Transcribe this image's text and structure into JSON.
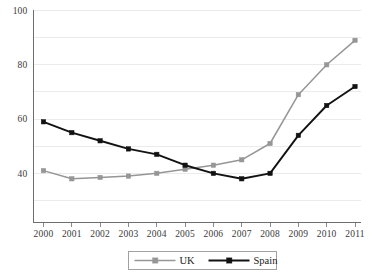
{
  "chart_data": {
    "type": "line",
    "title": "",
    "subtitle": "",
    "xlabel": "",
    "ylabel": "",
    "categories": [
      "2000",
      "2001",
      "2002",
      "2003",
      "2004",
      "2005",
      "2006",
      "2007",
      "2008",
      "2009",
      "2010",
      "2011"
    ],
    "x": [
      2000,
      2001,
      2002,
      2003,
      2004,
      2005,
      2006,
      2007,
      2008,
      2009,
      2010,
      2011
    ],
    "series": [
      {
        "name": "UK",
        "color": "#969696",
        "marker": "square",
        "values": [
          41,
          38,
          38.5,
          39,
          40,
          41.5,
          43,
          45,
          51,
          69,
          80,
          89
        ]
      },
      {
        "name": "Spain",
        "color": "#121212",
        "marker": "square",
        "values": [
          59,
          55,
          52,
          49,
          47,
          43,
          40,
          38,
          40,
          54,
          65,
          72
        ]
      }
    ],
    "ylim": [
      30,
      100
    ],
    "yticks": [
      30,
      40,
      50,
      60,
      70,
      80,
      90,
      100
    ],
    "ytick_labels": [
      "",
      "40",
      "",
      "60",
      "",
      "80",
      "",
      "100"
    ],
    "grid": true,
    "grid_axis": "y",
    "legend_position": "bottom",
    "legend_entries": [
      "UK",
      "Spain"
    ]
  },
  "axes": {
    "y_labels": [
      {
        "value": 100,
        "text": "100"
      },
      {
        "value": 80,
        "text": "80"
      },
      {
        "value": 60,
        "text": "60"
      },
      {
        "value": 40,
        "text": "40"
      }
    ],
    "x_labels": [
      "2000",
      "2001",
      "2002",
      "2003",
      "2004",
      "2005",
      "2006",
      "2007",
      "2008",
      "2009",
      "2010",
      "2011"
    ]
  },
  "legend": {
    "items": [
      {
        "label": "UK",
        "color": "#969696"
      },
      {
        "label": "Spain",
        "color": "#121212"
      }
    ]
  },
  "colors": {
    "uk": "#969696",
    "spain": "#121212",
    "grid": "#e3e3e3",
    "axis": "#6e6e6e",
    "text": "#1a1a1a",
    "background": "#ffffff"
  }
}
